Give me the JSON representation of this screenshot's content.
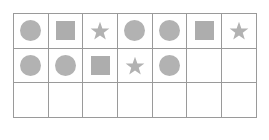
{
  "grid": {
    "rows": 3,
    "columns": 7,
    "cells": [
      [
        "circle",
        "square",
        "star",
        "circle",
        "circle",
        "square",
        "star"
      ],
      [
        "circle",
        "circle",
        "square",
        "star",
        "circle",
        "",
        ""
      ],
      [
        "",
        "",
        "",
        "",
        "",
        "",
        ""
      ]
    ]
  },
  "colors": {
    "shape": "#b2b2b2",
    "border": "#9a9a9a"
  }
}
